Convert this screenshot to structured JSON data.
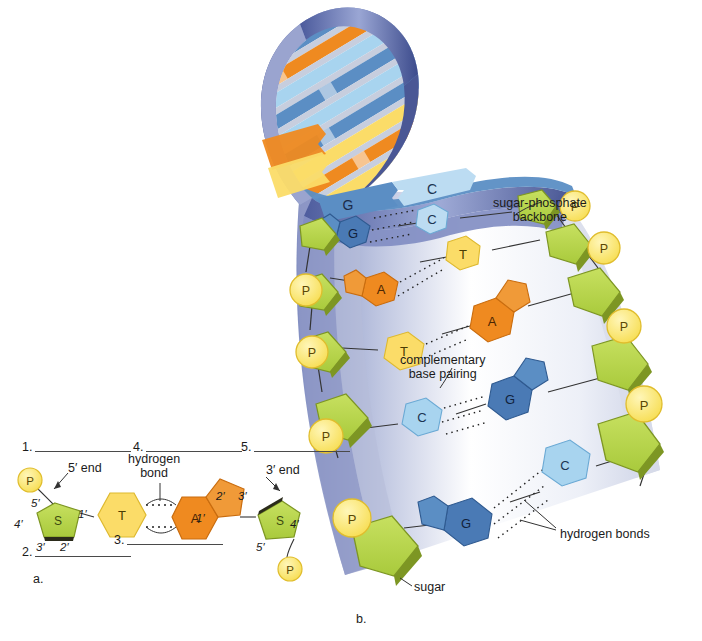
{
  "figure": {
    "title_panels": {
      "a": "a.",
      "b": "b."
    },
    "panel_b_labels": {
      "backbone": "sugar-phosphate\nbackbone",
      "backbone_line1": "sugar-phosphate",
      "backbone_line2": "backbone",
      "complementary_line1": "complementary",
      "complementary_line2": "base pairing",
      "hydrogen_bonds": "hydrogen bonds",
      "sugar": "sugar"
    },
    "panel_a_labels": {
      "hydrogen_line1": "hydrogen",
      "hydrogen_line2": "bond",
      "five_prime_end": "5′ end",
      "three_prime_end": "3′ end"
    },
    "blanks": [
      {
        "num": "1.",
        "width": 96
      },
      {
        "num": "2.",
        "width": 96
      },
      {
        "num": "3.",
        "width": 96
      },
      {
        "num": "4.",
        "width": 96
      },
      {
        "num": "5.",
        "width": 96
      }
    ],
    "nucleotide_left": {
      "phosphate": "P",
      "sugar": "S",
      "base": "T",
      "carbons": [
        "5′",
        "4′",
        "3′",
        "2′",
        "1′"
      ]
    },
    "nucleotide_right": {
      "phosphate": "P",
      "sugar": "S",
      "base": "A",
      "carbons": [
        "2′",
        "3′",
        "4′",
        "5′",
        "1′"
      ]
    },
    "ribbon_bases": [
      {
        "label": "G",
        "color": "#5b8ec4"
      },
      {
        "label": "C",
        "color": "#bcdcf2"
      }
    ],
    "base_pairs": [
      {
        "left": "G",
        "right": "C",
        "left_color": "#4a7ab5",
        "right_color": "#bcdcf2"
      },
      {
        "left": "A",
        "right": "T",
        "left_color": "#ef8a20",
        "right_color": "#fbdc68"
      },
      {
        "left": "T",
        "right": "A",
        "left_color": "#fbdc68",
        "right_color": "#ef8a20"
      },
      {
        "left": "C",
        "right": "G",
        "left_color": "#a8d4ef",
        "right_color": "#4a7ab5"
      },
      {
        "left": "G",
        "right": "C",
        "left_color": "#4a7ab5",
        "right_color": "#a8d4ef"
      }
    ],
    "phosphate_symbol": "P",
    "sugar_symbol": "S"
  },
  "colors": {
    "sugar_green": "#b5d44a",
    "sugar_green_dark": "#7d9623",
    "phosphate_yellow": "#fde96a",
    "phosphate_yellow_dark": "#e0bd2d",
    "adenine_orange": "#ef8a20",
    "adenine_orange_dark": "#d36f10",
    "thymine_yellow": "#fbdc68",
    "thymine_yellow_dark": "#e2bb33",
    "guanine_blue": "#4a7ab5",
    "guanine_blue_dark": "#2f5a90",
    "cytosine_blue": "#a8d4ef",
    "cytosine_blue_dark": "#6aa9d4",
    "helix_ribbon": "#6b7cb5",
    "helix_ribbon_dark": "#3c4b8c",
    "text": "#1b1b1b",
    "rule": "#4a4a4a"
  }
}
